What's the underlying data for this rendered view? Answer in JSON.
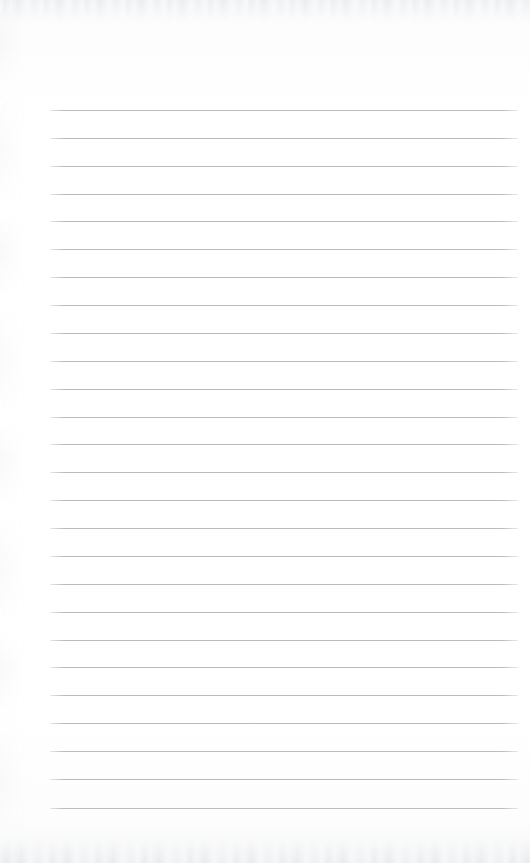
{
  "document": {
    "kind": "scanned-lined-notebook-page",
    "title": "",
    "body_text": "",
    "is_blank": true,
    "page_width": 530,
    "page_height": 863
  },
  "colors": {
    "page_background": "#fdfdfd",
    "rule_line": "#b8bcc0",
    "scan_noise": "#969ba2"
  },
  "ruling": {
    "line_count": 26,
    "first_line_y": 110,
    "line_spacing": 27.9,
    "line_left_x": 50,
    "line_right_x": 518,
    "line_thickness": 1,
    "lines_y": [
      110,
      138,
      166,
      194,
      221,
      249,
      277,
      305,
      333,
      361,
      389,
      417,
      444,
      472,
      500,
      528,
      556,
      584,
      612,
      640,
      667,
      695,
      723,
      751,
      779,
      808
    ]
  },
  "margins": {
    "top_margin_height": 110,
    "bottom_margin_height": 55,
    "left_margin_width": 50,
    "right_margin_width": 12
  }
}
